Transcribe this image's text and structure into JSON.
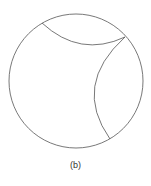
{
  "figure": {
    "label": "(b)",
    "stroke_color": "#555555",
    "circle": {
      "cx": 76,
      "cy": 81,
      "r": 67
    },
    "arcs": [
      {
        "name": "top-arc",
        "from": [
          42,
          23
        ],
        "to": [
          125,
          37
        ]
      },
      {
        "name": "right-arc",
        "from": [
          125,
          37
        ],
        "to": [
          110,
          139
        ]
      }
    ]
  }
}
